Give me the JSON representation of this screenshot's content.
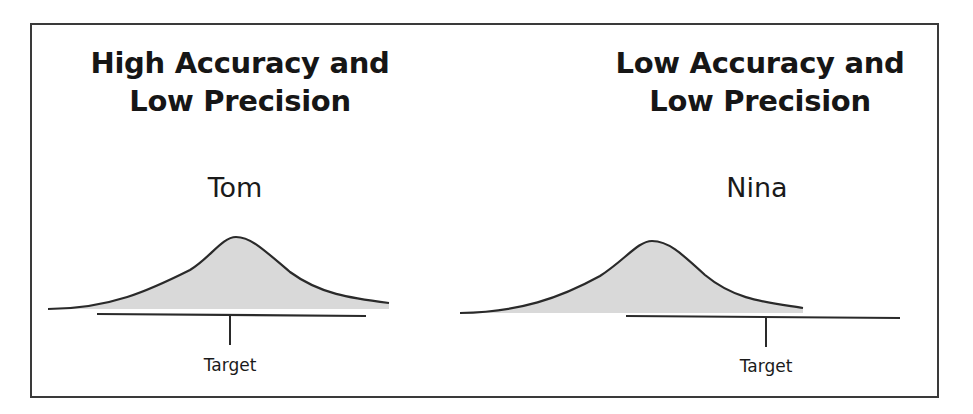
{
  "panels": [
    {
      "title_line1": "High Accuracy and",
      "title_line2": "Low Precision",
      "person": "Tom",
      "target_label": "Target",
      "accuracy": "High",
      "precision": "Low"
    },
    {
      "title_line1": "Low Accuracy and",
      "title_line2": "Low Precision",
      "person": "Nina",
      "target_label": "Target",
      "accuracy": "Low",
      "precision": "Low"
    }
  ],
  "colors": {
    "curve_stroke": "#2a2a2a",
    "curve_fill": "#d9d9d9",
    "frame": "#3a3a3a"
  }
}
